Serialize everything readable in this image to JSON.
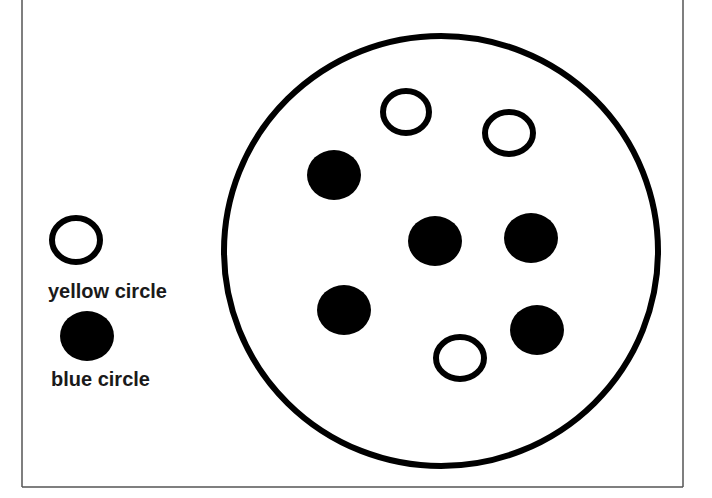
{
  "diagram": {
    "type": "set-diagram",
    "frame": {
      "left": 22,
      "right": 683,
      "bottom": 487,
      "color": "#555555"
    },
    "container": {
      "shape": "circle",
      "cx": 441,
      "cy": 251,
      "rx": 217,
      "ry": 215,
      "stroke": "#000000"
    },
    "legend": {
      "items": [
        {
          "label": "yellow circle",
          "style": "hollow",
          "cx": 76,
          "cy": 240
        },
        {
          "label": "blue circle",
          "style": "filled",
          "cx": 87,
          "cy": 336
        }
      ]
    },
    "shapes": [
      {
        "kind": "yellow circle",
        "style": "hollow",
        "cx": 406,
        "cy": 112,
        "rx": 25,
        "ry": 23
      },
      {
        "kind": "yellow circle",
        "style": "hollow",
        "cx": 509,
        "cy": 133,
        "rx": 26,
        "ry": 23
      },
      {
        "kind": "yellow circle",
        "style": "hollow",
        "cx": 460,
        "cy": 358,
        "rx": 26,
        "ry": 23
      },
      {
        "kind": "blue circle",
        "style": "filled",
        "cx": 334,
        "cy": 175,
        "rx": 27,
        "ry": 25
      },
      {
        "kind": "blue circle",
        "style": "filled",
        "cx": 435,
        "cy": 241,
        "rx": 27,
        "ry": 25
      },
      {
        "kind": "blue circle",
        "style": "filled",
        "cx": 531,
        "cy": 238,
        "rx": 27,
        "ry": 25
      },
      {
        "kind": "blue circle",
        "style": "filled",
        "cx": 344,
        "cy": 310,
        "rx": 27,
        "ry": 25
      },
      {
        "kind": "blue circle",
        "style": "filled",
        "cx": 537,
        "cy": 330,
        "rx": 27,
        "ry": 25
      }
    ],
    "counts": {
      "yellow circle": 3,
      "blue circle": 5
    }
  }
}
